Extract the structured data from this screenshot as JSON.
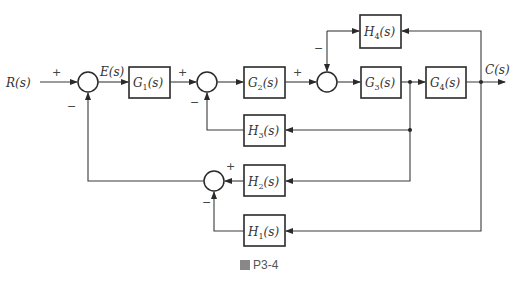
{
  "diagram": {
    "input": "R(s)",
    "error": "E(s)",
    "output": "C(s)",
    "blocks": {
      "G1": {
        "name": "G",
        "sub": "1",
        "suffix": "(s)"
      },
      "G2": {
        "name": "G",
        "sub": "2",
        "suffix": "(s)"
      },
      "G3": {
        "name": "G",
        "sub": "3",
        "suffix": "(s)"
      },
      "G4": {
        "name": "G",
        "sub": "4",
        "suffix": "(s)"
      },
      "H1": {
        "name": "H",
        "sub": "1",
        "suffix": "(s)"
      },
      "H2": {
        "name": "H",
        "sub": "2",
        "suffix": "(s)"
      },
      "H3": {
        "name": "H",
        "sub": "3",
        "suffix": "(s)"
      },
      "H4": {
        "name": "H",
        "sub": "4",
        "suffix": "(s)"
      }
    },
    "signs": {
      "s1_in": "+",
      "s1_fb": "−",
      "s2_in": "+",
      "s2_fb": "−",
      "s3_in": "+",
      "s3_fb": "−",
      "s4_in": "+",
      "s4_fb": "−"
    }
  },
  "caption": {
    "prefix": "圖",
    "label": "P3-4"
  }
}
